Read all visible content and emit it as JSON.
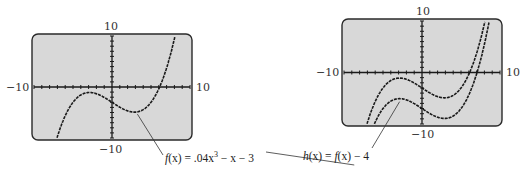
{
  "chart_data": [
    {
      "type": "line",
      "title": "",
      "window": {
        "xmin": -10,
        "xmax": 10,
        "ymin": -10,
        "ymax": 10,
        "xscl": 1,
        "yscl": 1
      },
      "tick_labels": {
        "top": "10",
        "bottom": "-10",
        "left": "-10",
        "right": "10"
      },
      "series": [
        {
          "name": "f(x) = .04x^3 - x - 3",
          "function": "0.04*x^3 - x - 3",
          "shift": 0
        }
      ],
      "annotation": {
        "label_html": "f(x) = .04x³ − x − 3",
        "points_to_x": 3
      },
      "grid": false
    },
    {
      "type": "line",
      "title": "",
      "window": {
        "xmin": -10,
        "xmax": 10,
        "ymin": -10,
        "ymax": 10,
        "xscl": 1,
        "yscl": 1
      },
      "tick_labels": {
        "top": "10",
        "bottom": "-10",
        "left": "-10",
        "right": "10"
      },
      "series": [
        {
          "name": "f(x) = .04x^3 - x - 3",
          "function": "0.04*x^3 - x - 3",
          "shift": 0
        },
        {
          "name": "h(x) = f(x) - 4",
          "function": "0.04*x^3 - x - 7",
          "shift": -4
        }
      ],
      "annotation": {
        "label_html": "h(x) = f(x) − 4",
        "points_to_x": -3
      },
      "grid": false
    }
  ],
  "labels": {
    "left": {
      "top": "10",
      "bottom": "−10",
      "left": "−10",
      "right": "10"
    },
    "right": {
      "top": "10",
      "bottom": "−10",
      "left": "−10",
      "right": "10"
    },
    "caption_f_prefix": "f",
    "caption_f_rest": "(x) = .04x",
    "caption_f_exp": "3",
    "caption_f_tail": " − x − 3",
    "caption_h_prefix": "h",
    "caption_h_rest": "(x) = ",
    "caption_h_f": "f",
    "caption_h_tail": "(x) − 4"
  },
  "colors": {
    "screen": "#d8d8d8",
    "border": "#2a2a2a",
    "curve": "#1a1a1a",
    "axis": "#1a1a1a"
  }
}
